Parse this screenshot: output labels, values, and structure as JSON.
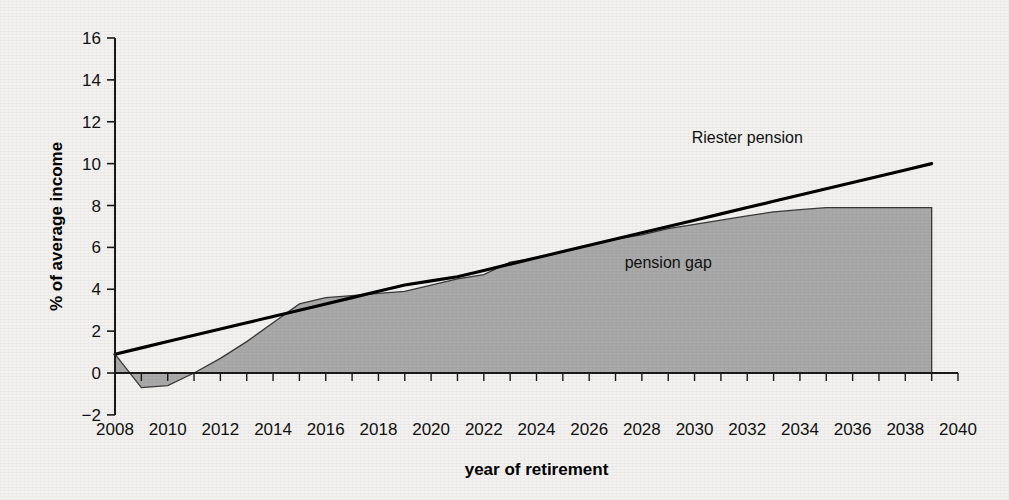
{
  "chart_data": {
    "type": "area",
    "title": "",
    "xlabel": "year of retirement",
    "ylabel": "% of average income",
    "xlim": [
      2008,
      2040
    ],
    "ylim": [
      -2,
      16
    ],
    "ytick_step": 2,
    "xtick_step": 1,
    "xtick_label_step": 2,
    "grid": false,
    "legend_position": "inline-annotation",
    "xticklabels": [
      "2008",
      "2010",
      "2012",
      "2014",
      "2016",
      "2018",
      "2020",
      "2022",
      "2024",
      "2026",
      "2028",
      "2030",
      "2032",
      "2034",
      "2036",
      "2038",
      "2040"
    ],
    "yticklabels": [
      "-2",
      "0",
      "2",
      "4",
      "6",
      "8",
      "10",
      "12",
      "14",
      "16"
    ],
    "x": [
      2008,
      2009,
      2010,
      2011,
      2012,
      2013,
      2014,
      2015,
      2016,
      2017,
      2018,
      2019,
      2020,
      2021,
      2022,
      2023,
      2024,
      2025,
      2026,
      2027,
      2028,
      2029,
      2030,
      2031,
      2032,
      2033,
      2034,
      2035,
      2036,
      2037,
      2038,
      2039
    ],
    "series": [
      {
        "name": "Riester pension",
        "type": "line",
        "label": "Riester pension",
        "label_x": 2032,
        "label_y": 11.0,
        "color": "#000000",
        "values": [
          0.9,
          1.2,
          1.5,
          1.8,
          2.1,
          2.4,
          2.7,
          3.0,
          3.3,
          3.6,
          3.9,
          4.2,
          4.4,
          4.6,
          4.9,
          5.2,
          5.5,
          5.8,
          6.1,
          6.4,
          6.7,
          7.0,
          7.3,
          7.6,
          7.9,
          8.2,
          8.5,
          8.8,
          9.1,
          9.4,
          9.7,
          10.0
        ]
      },
      {
        "name": "pension gap",
        "type": "area",
        "label": "pension gap",
        "label_x": 2029,
        "label_y": 5.0,
        "color": "#a9a9a9",
        "values": [
          0.9,
          -0.7,
          -0.6,
          0.0,
          0.7,
          1.5,
          2.4,
          3.3,
          3.6,
          3.7,
          3.8,
          3.9,
          4.2,
          4.5,
          4.7,
          5.3,
          5.5,
          5.8,
          6.1,
          6.4,
          6.6,
          6.9,
          7.1,
          7.3,
          7.5,
          7.7,
          7.8,
          7.9,
          7.9,
          7.9,
          7.9,
          7.9
        ]
      }
    ]
  },
  "labels": {
    "riester_series_label": "Riester pension",
    "gap_series_label": "pension gap",
    "x_axis_title": "year of retirement",
    "y_axis_title": "% of average income"
  }
}
